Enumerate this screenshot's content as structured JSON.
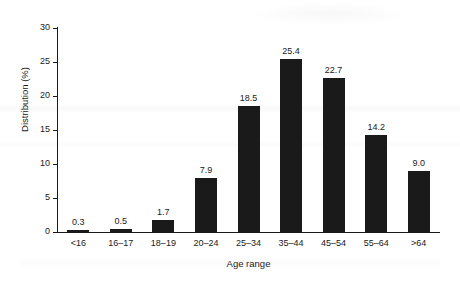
{
  "chart_data": {
    "type": "bar",
    "title": "",
    "xlabel": "Age range",
    "ylabel": "Distribution (%)",
    "categories": [
      "<16",
      "16–17",
      "18–19",
      "20–24",
      "25–34",
      "35–44",
      "45–54",
      "55–64",
      ">64"
    ],
    "values": [
      0.3,
      0.5,
      1.7,
      7.9,
      18.5,
      25.4,
      22.7,
      14.2,
      9.0
    ],
    "value_labels": [
      "0.3",
      "0.5",
      "1.7",
      "7.9",
      "18.5",
      "25.4",
      "22.7",
      "14.2",
      "9.0"
    ],
    "ylim": [
      0,
      30
    ],
    "yticks": [
      0,
      5,
      10,
      15,
      20,
      25,
      30
    ],
    "ytick_labels": [
      "0",
      "5",
      "10",
      "15",
      "20",
      "25",
      "30"
    ],
    "grid": false,
    "legend": null,
    "bar_color": "#1a1a1a",
    "axis_color": "#1a1a1a",
    "background_color": "#ffffff"
  }
}
